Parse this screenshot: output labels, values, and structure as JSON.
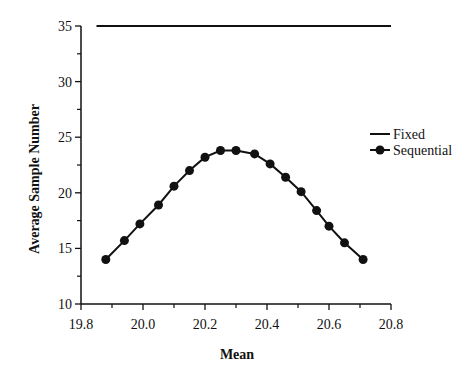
{
  "chart_data": {
    "type": "line",
    "title": "",
    "xlabel": "Mean",
    "ylabel": "Average Sample Number",
    "xlim": [
      19.8,
      20.8
    ],
    "ylim": [
      10,
      35
    ],
    "xticks": [
      19.8,
      20.0,
      20.2,
      20.4,
      20.6,
      20.8
    ],
    "xtick_labels": [
      "19.8",
      "20.0",
      "20.2",
      "20.4",
      "20.6",
      "20.8"
    ],
    "yticks": [
      10,
      15,
      20,
      25,
      30,
      35
    ],
    "ytick_labels": [
      "10",
      "15",
      "20",
      "25",
      "30",
      "35"
    ],
    "grid": false,
    "legend_position": "right",
    "series": [
      {
        "name": "Fixed",
        "marker": "none",
        "x": [
          19.85,
          20.8
        ],
        "values": [
          35,
          35
        ]
      },
      {
        "name": "Sequential",
        "marker": "circle",
        "x": [
          19.88,
          19.94,
          19.99,
          20.05,
          20.1,
          20.15,
          20.2,
          20.25,
          20.3,
          20.36,
          20.41,
          20.46,
          20.51,
          20.56,
          20.6,
          20.65,
          20.71
        ],
        "values": [
          14.0,
          15.7,
          17.2,
          18.9,
          20.6,
          22.0,
          23.2,
          23.8,
          23.8,
          23.5,
          22.6,
          21.4,
          20.1,
          18.4,
          17.0,
          15.5,
          14.0
        ]
      }
    ]
  },
  "legend": {
    "items": [
      {
        "label": "Fixed"
      },
      {
        "label": "Sequential"
      }
    ]
  },
  "colors": {
    "line": "#111111",
    "axis": "#111111",
    "background": "#ffffff"
  }
}
